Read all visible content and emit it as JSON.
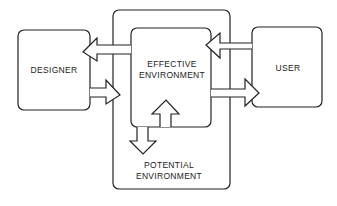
{
  "diagram": {
    "type": "block-diagram",
    "nodes": {
      "designer": {
        "label": "DESIGNER"
      },
      "user": {
        "label": "USER"
      },
      "effective": {
        "line1": "EFFECTIVE",
        "line2": "ENVIRONMENT"
      },
      "potential": {
        "line1": "POTENTIAL",
        "line2": "ENVIRONMENT"
      }
    },
    "edges": [
      {
        "from": "effective",
        "to": "designer"
      },
      {
        "from": "designer",
        "to": "effective"
      },
      {
        "from": "user",
        "to": "effective"
      },
      {
        "from": "effective",
        "to": "user"
      },
      {
        "from": "effective",
        "to": "potential"
      },
      {
        "from": "potential",
        "to": "effective"
      }
    ],
    "colors": {
      "stroke": "#222222",
      "background": "#ffffff"
    }
  }
}
